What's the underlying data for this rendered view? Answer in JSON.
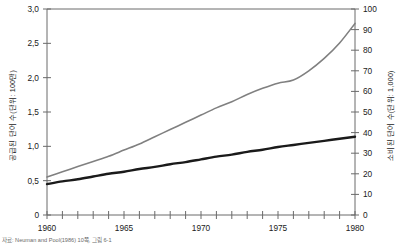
{
  "chart_data": {
    "type": "line",
    "title": "",
    "subtitle": "",
    "xlabel": "",
    "ylabel": "공급된 단어 수(단위: 100만)",
    "ylabel_right": "소비된 단어 수(단위: 1,000)",
    "xlim": [
      1960,
      1980
    ],
    "ylim": [
      0,
      3.0
    ],
    "ylim_right": [
      0,
      100
    ],
    "grid": false,
    "legend": "none",
    "x_ticks": [
      1960,
      1965,
      1970,
      1975,
      1980
    ],
    "x_tick_labels": [
      "1960",
      "1965",
      "1970",
      "1975",
      "1980"
    ],
    "x_minor_step": 1,
    "y_ticks_left": [
      0,
      0.5,
      1.0,
      1.5,
      2.0,
      2.5,
      3.0
    ],
    "y_tick_labels_left": [
      "0",
      "0,5",
      "1,0",
      "1,5",
      "2,0",
      "2,5",
      "3,0"
    ],
    "y_ticks_right": [
      0,
      10,
      20,
      30,
      40,
      50,
      60,
      70,
      80,
      90,
      100
    ],
    "y_tick_labels_right": [
      "0",
      "10",
      "20",
      "30",
      "40",
      "50",
      "60",
      "70",
      "80",
      "90",
      "100"
    ],
    "x": [
      1960,
      1961,
      1962,
      1963,
      1964,
      1965,
      1966,
      1967,
      1968,
      1969,
      1970,
      1971,
      1972,
      1973,
      1974,
      1975,
      1976,
      1977,
      1978,
      1979,
      1980
    ],
    "series": [
      {
        "name": "소비된 단어 수",
        "axis": "right",
        "color": "#808080",
        "width": 1.6,
        "values": [
          18.5,
          21.0,
          23.5,
          26.0,
          28.5,
          31.5,
          34.5,
          38.0,
          41.5,
          45.0,
          48.5,
          52.0,
          55.0,
          58.5,
          61.5,
          64.0,
          65.5,
          70.0,
          76.0,
          83.5,
          93.0
        ]
      },
      {
        "name": "공급된 단어 수",
        "axis": "left",
        "color": "#1a1a1a",
        "width": 2.4,
        "values": [
          0.45,
          0.49,
          0.52,
          0.56,
          0.6,
          0.63,
          0.67,
          0.7,
          0.74,
          0.77,
          0.81,
          0.85,
          0.88,
          0.92,
          0.95,
          0.99,
          1.02,
          1.05,
          1.08,
          1.11,
          1.14
        ]
      }
    ]
  },
  "caption": {
    "text": "자료: Neuman and Pool(1986) 10쪽, 그림 6-1"
  },
  "colors": {
    "axis": "#6a6a6a",
    "text": "#1a1a1a",
    "series_gray": "#808080",
    "series_black": "#1a1a1a",
    "caption": "#6a6a6a"
  }
}
